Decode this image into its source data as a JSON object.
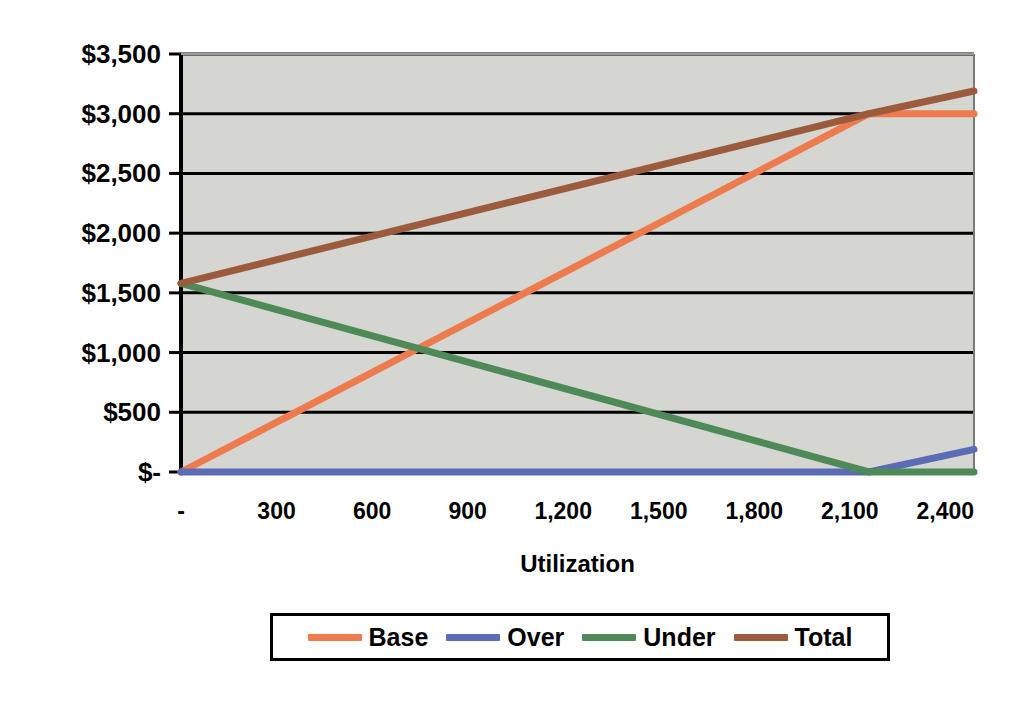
{
  "chart_data": {
    "type": "line",
    "title": "",
    "xlabel": "Utilization",
    "ylabel": "",
    "grid": true,
    "legend_position": "bottom",
    "xlim": [
      0,
      2490
    ],
    "ylim": [
      0,
      3500
    ],
    "x_ticks": [
      0,
      300,
      600,
      900,
      1200,
      1500,
      1800,
      2100,
      2400
    ],
    "x_tick_labels": [
      "-",
      "300",
      "600",
      "900",
      "1,200",
      "1,500",
      "1,800",
      "2,100",
      "2,400"
    ],
    "y_ticks": [
      0,
      500,
      1000,
      1500,
      2000,
      2500,
      3000,
      3500
    ],
    "y_tick_labels": [
      "$-",
      "$500",
      "$1,000",
      "$1,500",
      "$2,000",
      "$2,500",
      "$3,000",
      "$3,500"
    ],
    "series": [
      {
        "name": "Base",
        "color": "#EE7B4D",
        "x": [
          0,
          2160,
          2490
        ],
        "values": [
          0,
          3000,
          3000
        ]
      },
      {
        "name": "Over",
        "color": "#5B6BB5",
        "x": [
          0,
          2160,
          2490
        ],
        "values": [
          0,
          0,
          190
        ]
      },
      {
        "name": "Under",
        "color": "#4E8A57",
        "x": [
          0,
          2160,
          2490
        ],
        "values": [
          1580,
          0,
          0
        ]
      },
      {
        "name": "Total",
        "color": "#9C5B3C",
        "x": [
          0,
          2160,
          2490
        ],
        "values": [
          1580,
          3000,
          3190
        ]
      }
    ]
  },
  "legend": {
    "entries": [
      {
        "label": "Base",
        "color": "#EE7B4D"
      },
      {
        "label": "Over",
        "color": "#5B6BB5"
      },
      {
        "label": "Under",
        "color": "#4E8A57"
      },
      {
        "label": "Total",
        "color": "#9C5B3C"
      }
    ]
  },
  "axes": {
    "x_title": "Utilization"
  },
  "colors": {
    "plot_background": "#D5D5D1",
    "gridline": "#000000",
    "axis": "#000000",
    "text": "#000000",
    "page_background": "#FFFFFF"
  }
}
